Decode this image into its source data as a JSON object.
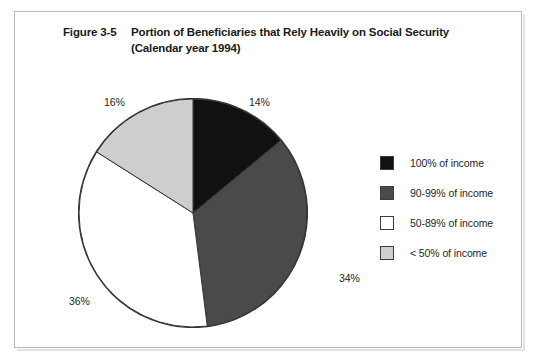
{
  "figure": {
    "number": "Figure 3-5",
    "title_line1": "Portion of Beneficiaries that Rely Heavily on Social Security",
    "title_line2": "(Calendar year 1994)"
  },
  "chart_data": {
    "type": "pie",
    "title": "Portion of Beneficiaries that Rely Heavily on Social Security (Calendar year 1994)",
    "xlabel": "",
    "ylabel": "",
    "grid": false,
    "legend_position": "right",
    "start_angle_deg": 0,
    "direction": "clockwise",
    "categories": [
      "100% of income",
      "90-99% of income",
      "50-89% of income",
      "< 50% of income"
    ],
    "values": [
      14,
      34,
      36,
      16
    ],
    "value_labels": [
      "14%",
      "34%",
      "36%",
      "16%"
    ],
    "units": "percent of beneficiaries",
    "colors": [
      "#111111",
      "#4a4a4a",
      "#ffffff",
      "#cecece"
    ],
    "slice_border_color": "#333333",
    "slices": [
      {
        "label": "100% of income",
        "value": 14,
        "display": "14%",
        "color": "#111111"
      },
      {
        "label": "90-99% of income",
        "value": 34,
        "display": "34%",
        "color": "#4a4a4a"
      },
      {
        "label": "50-89% of income",
        "value": 36,
        "display": "36%",
        "color": "#ffffff"
      },
      {
        "label": "< 50% of income",
        "value": 16,
        "display": "16%",
        "color": "#cecece"
      }
    ]
  },
  "legend": {
    "items": [
      {
        "label": "100% of income",
        "color": "#111111"
      },
      {
        "label": "90-99% of income",
        "color": "#4a4a4a"
      },
      {
        "label": "50-89% of income",
        "color": "#ffffff"
      },
      {
        "label": "< 50% of income",
        "color": "#cecece"
      }
    ]
  }
}
